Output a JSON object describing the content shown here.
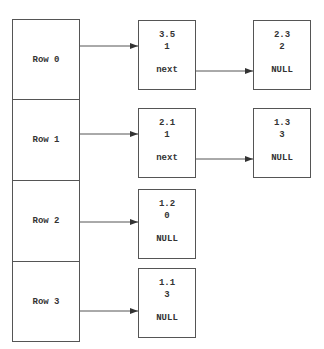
{
  "rows": [
    {
      "label": "Row 0"
    },
    {
      "label": "Row 1"
    },
    {
      "label": "Row 2"
    },
    {
      "label": "Row 3"
    }
  ],
  "nodes": [
    {
      "row": 0,
      "value": "3.5",
      "col": "1",
      "ptr": "next"
    },
    {
      "row": 0,
      "value": "2.3",
      "col": "2",
      "ptr": "NULL"
    },
    {
      "row": 1,
      "value": "2.1",
      "col": "1",
      "ptr": "next"
    },
    {
      "row": 1,
      "value": "1.3",
      "col": "3",
      "ptr": "NULL"
    },
    {
      "row": 2,
      "value": "1.2",
      "col": "0",
      "ptr": "NULL"
    },
    {
      "row": 3,
      "value": "1.1",
      "col": "3",
      "ptr": "NULL"
    }
  ],
  "colors": {
    "line": "#555555",
    "text": "#333333",
    "background": "#ffffff"
  }
}
